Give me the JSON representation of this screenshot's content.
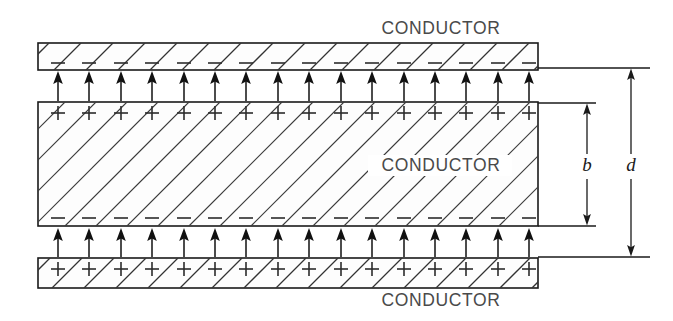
{
  "figure": {
    "type": "physics-diagram",
    "background_color": "#ffffff",
    "line_color": "#1a1a1a",
    "label_color": "#4a4a4a"
  },
  "labels": {
    "top_conductor": "CONDUCTOR",
    "middle_conductor": "CONDUCTOR",
    "bottom_conductor": "CONDUCTOR",
    "dimension_b": "b",
    "dimension_d": "d"
  },
  "geometry": {
    "plate_left_x": 38,
    "plate_right_x": 538,
    "top_plate": {
      "y_top": 43,
      "y_bottom": 70,
      "hatch_spacing": 32,
      "hatch_direction": "up-right"
    },
    "middle_slab": {
      "y_top": 102,
      "y_bottom": 226,
      "hatch_spacing": 31,
      "hatch_direction": "up-right"
    },
    "bottom_plate": {
      "y_top": 258,
      "y_bottom": 288,
      "hatch_spacing": 32,
      "hatch_direction": "up-right"
    },
    "charge_count": 16,
    "charge_first_x": 58,
    "charge_spacing": 31.4,
    "arrow_count": 16,
    "upper_gap": {
      "y_from": 102,
      "y_to": 70
    },
    "lower_gap": {
      "y_from": 258,
      "y_to": 226
    }
  },
  "charges": {
    "top_plate_row": "minus",
    "slab_top_row": "plus",
    "slab_bottom_row": "minus",
    "bottom_plate_row": "plus"
  },
  "field_arrows": {
    "direction": "upward",
    "upper_gap_count": 16,
    "lower_gap_count": 16
  },
  "dimensions": [
    {
      "name": "b",
      "label": "b",
      "measures": "slab thickness",
      "y_top": 103,
      "y_bottom": 226,
      "line_x": 587,
      "extension_right_x": 596,
      "label_x": 587,
      "label_y": 166
    },
    {
      "name": "d",
      "label": "d",
      "measures": "plate separation",
      "y_top": 68,
      "y_bottom": 257,
      "line_x": 631,
      "extension_right_x": 650,
      "label_x": 631,
      "label_y": 166
    }
  ]
}
